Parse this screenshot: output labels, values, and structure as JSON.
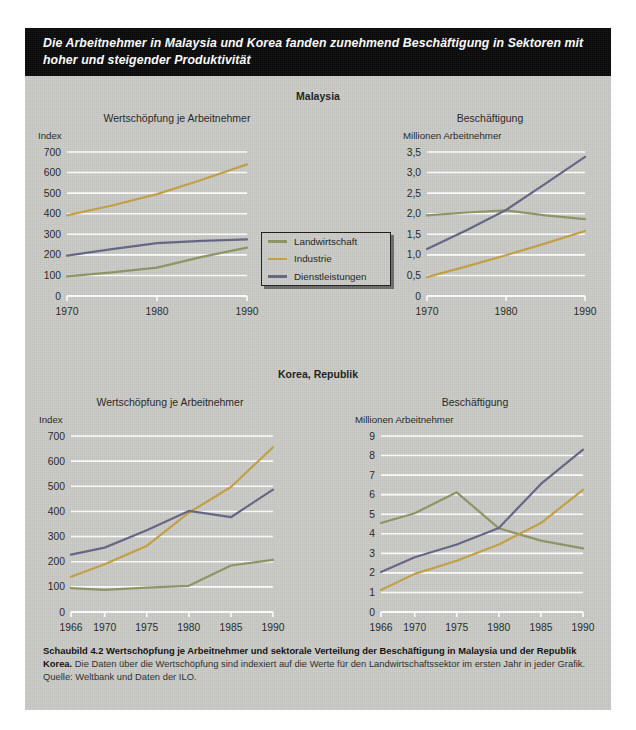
{
  "headline": "Die Arbeitnehmer in Malaysia und Korea fanden zunehmend Beschäftigung in Sektoren mit hoher und steigender Produktivität",
  "colors": {
    "landwirtschaft": "#8b9563",
    "industrie": "#c3a041",
    "dienstleistungen": "#636484",
    "panel_bg": "#c9cac6",
    "grid": "#ffffff",
    "headline_bg": "#070707"
  },
  "legend": {
    "items": [
      {
        "label": "Landwirtschaft",
        "color": "#8b9563"
      },
      {
        "label": "Industrie",
        "color": "#c3a041"
      },
      {
        "label": "Dienstleistungen",
        "color": "#636484"
      }
    ]
  },
  "sections": [
    {
      "id": "malaysia",
      "title": "Malaysia"
    },
    {
      "id": "korea",
      "title": "Korea, Republik"
    }
  ],
  "caption": {
    "strong": "Schaubild 4.2   Wertschöpfung je Arbeitnehmer und sektorale Verteilung der Beschäftigung in Malaysia und der Republik Korea.",
    "rest": " Die Daten über die Wertschöpfung sind indexiert auf die Werte für den Landwirtschaftssektor im ersten Jahr in jeder Grafik. Quelle: Weltbank und Daten der ILO."
  },
  "chart_data": [
    {
      "id": "malaysia-value-added",
      "type": "line",
      "title": "Wertschöpfung je Arbeitnehmer",
      "ylabel": "Index",
      "xlabel": "",
      "x": [
        1970,
        1980,
        1990
      ],
      "xticks": [
        "1970",
        "1980",
        "1990"
      ],
      "yticks": [
        0,
        100,
        200,
        300,
        400,
        500,
        600,
        700
      ],
      "yticklabels": [
        "0",
        "100",
        "200",
        "300",
        "400",
        "500",
        "600",
        "700"
      ],
      "ylim": [
        0,
        700
      ],
      "xlim": [
        1970,
        1990
      ],
      "grid": true,
      "legend": "center",
      "series": [
        {
          "name": "Landwirtschaft",
          "color": "#8b9563",
          "x": [
            1970,
            1975,
            1980,
            1985,
            1990
          ],
          "values": [
            95,
            115,
            138,
            190,
            235
          ]
        },
        {
          "name": "Industrie",
          "color": "#c3a041",
          "x": [
            1970,
            1975,
            1980,
            1985,
            1990
          ],
          "values": [
            392,
            440,
            495,
            565,
            640
          ]
        },
        {
          "name": "Dienstleistungen",
          "color": "#636484",
          "x": [
            1970,
            1975,
            1980,
            1985,
            1990
          ],
          "values": [
            196,
            228,
            257,
            268,
            275
          ]
        }
      ]
    },
    {
      "id": "malaysia-employment",
      "type": "line",
      "title": "Beschäftigung",
      "ylabel": "Millionen Arbeitnehmer",
      "xlabel": "",
      "x": [
        1970,
        1980,
        1990
      ],
      "xticks": [
        "1970",
        "1980",
        "1990"
      ],
      "yticks": [
        0,
        0.5,
        1.0,
        1.5,
        2.0,
        2.5,
        3.0,
        3.5
      ],
      "yticklabels": [
        "0",
        "0,5",
        "1,0",
        "1,5",
        "2,0",
        "2,5",
        "3,0",
        "3,5"
      ],
      "ylim": [
        0,
        3.5
      ],
      "xlim": [
        1970,
        1990
      ],
      "grid": true,
      "series": [
        {
          "name": "Landwirtschaft",
          "color": "#8b9563",
          "x": [
            1970,
            1975,
            1980,
            1985,
            1990
          ],
          "values": [
            1.96,
            2.03,
            2.08,
            1.96,
            1.87
          ]
        },
        {
          "name": "Industrie",
          "color": "#c3a041",
          "x": [
            1970,
            1975,
            1980,
            1985,
            1990
          ],
          "values": [
            0.46,
            0.72,
            0.99,
            1.28,
            1.58
          ]
        },
        {
          "name": "Dienstleistungen",
          "color": "#636484",
          "x": [
            1970,
            1975,
            1980,
            1985,
            1990
          ],
          "values": [
            1.14,
            1.6,
            2.09,
            2.73,
            3.38
          ]
        }
      ]
    },
    {
      "id": "korea-value-added",
      "type": "line",
      "title": "Wertschöpfung je Arbeitnehmer",
      "ylabel": "Index",
      "xlabel": "",
      "x": [
        1966,
        1970,
        1975,
        1980,
        1985,
        1990
      ],
      "xticks": [
        "1966",
        "1970",
        "1975",
        "1980",
        "1985",
        "1990"
      ],
      "yticks": [
        0,
        100,
        200,
        300,
        400,
        500,
        600,
        700
      ],
      "yticklabels": [
        "0",
        "100",
        "200",
        "300",
        "400",
        "500",
        "600",
        "700"
      ],
      "ylim": [
        0,
        700
      ],
      "xlim": [
        1966,
        1990
      ],
      "grid": true,
      "series": [
        {
          "name": "Landwirtschaft",
          "color": "#8b9563",
          "x": [
            1966,
            1970,
            1975,
            1980,
            1985,
            1990
          ],
          "values": [
            95,
            88,
            97,
            104,
            185,
            207
          ]
        },
        {
          "name": "Industrie",
          "color": "#c3a041",
          "x": [
            1966,
            1970,
            1975,
            1980,
            1985,
            1990
          ],
          "values": [
            140,
            190,
            263,
            395,
            497,
            655
          ]
        },
        {
          "name": "Dienstleistungen",
          "color": "#636484",
          "x": [
            1966,
            1970,
            1975,
            1980,
            1985,
            1990
          ],
          "values": [
            228,
            256,
            325,
            402,
            377,
            487
          ]
        }
      ]
    },
    {
      "id": "korea-employment",
      "type": "line",
      "title": "Beschäftigung",
      "ylabel": "Millionen Arbeitnehmer",
      "xlabel": "",
      "x": [
        1966,
        1970,
        1975,
        1980,
        1985,
        1990
      ],
      "xticks": [
        "1966",
        "1970",
        "1975",
        "1980",
        "1985",
        "1990"
      ],
      "yticks": [
        0,
        1,
        2,
        3,
        4,
        5,
        6,
        7,
        8,
        9
      ],
      "yticklabels": [
        "0",
        "1",
        "2",
        "3",
        "4",
        "5",
        "6",
        "7",
        "8",
        "9"
      ],
      "ylim": [
        0,
        9
      ],
      "xlim": [
        1966,
        1990
      ],
      "grid": true,
      "series": [
        {
          "name": "Landwirtschaft",
          "color": "#8b9563",
          "x": [
            1966,
            1970,
            1975,
            1980,
            1985,
            1990
          ],
          "values": [
            4.55,
            5.05,
            6.12,
            4.28,
            3.65,
            3.25
          ]
        },
        {
          "name": "Industrie",
          "color": "#c3a041",
          "x": [
            1966,
            1970,
            1975,
            1980,
            1985,
            1990
          ],
          "values": [
            1.12,
            1.95,
            2.62,
            3.45,
            4.55,
            6.25
          ]
        },
        {
          "name": "Dienstleistungen",
          "color": "#636484",
          "x": [
            1966,
            1970,
            1975,
            1980,
            1985,
            1990
          ],
          "values": [
            2.05,
            2.8,
            3.45,
            4.3,
            6.55,
            8.3
          ]
        }
      ]
    }
  ]
}
